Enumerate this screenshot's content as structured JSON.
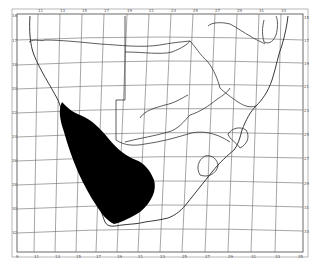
{
  "map": {
    "type": "distribution range map",
    "region": "Southern Africa",
    "colors": {
      "range": "#000000",
      "lines": "#333333",
      "background": "#ffffff"
    },
    "top_labels": [
      "11",
      "13",
      "15",
      "17",
      "19",
      "21",
      "23",
      "25",
      "27",
      "29",
      "31",
      "33",
      "35",
      "37"
    ],
    "bottom_labels": [
      "9",
      "11",
      "13",
      "15",
      "17",
      "19",
      "21",
      "23",
      "25",
      "27",
      "29",
      "31",
      "33",
      "35",
      "37",
      "39"
    ],
    "left_labels": [
      "16",
      "17",
      "18",
      "20",
      "22",
      "24",
      "26",
      "28",
      "30",
      "32",
      "34"
    ],
    "right_labels": [
      "15",
      "17",
      "19",
      "21",
      "23",
      "25",
      "27",
      "29",
      "31",
      "33",
      "35"
    ],
    "range_label": "species distribution"
  }
}
